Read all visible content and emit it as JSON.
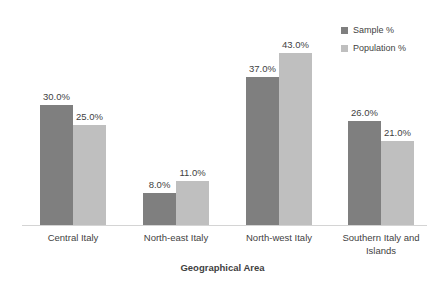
{
  "chart_data": {
    "type": "bar",
    "title": "",
    "subtitle": "",
    "xlabel": "Geographical Area",
    "ylabel": "",
    "categories": [
      "Central Italy",
      "North-east Italy",
      "North-west Italy",
      "Southern Italy and Islands"
    ],
    "series": [
      {
        "name": "Sample %",
        "color": "#7f7f7f",
        "values": [
          30.0,
          8.0,
          37.0,
          26.0
        ],
        "labels": [
          "30.0%",
          "8.0%",
          "37.0%",
          "26.0%"
        ]
      },
      {
        "name": "Population %",
        "color": "#bfbfbf",
        "values": [
          25.0,
          11.0,
          43.0,
          21.0
        ],
        "labels": [
          "25.0%",
          "11.0%",
          "43.0%",
          "21.0%"
        ]
      }
    ],
    "ylim": [
      0,
      47
    ],
    "grid": false,
    "y_axis_visible": false,
    "data_labels": true,
    "legend_position": "top-right"
  },
  "legend": {
    "entries": [
      {
        "label": "Sample %",
        "color": "#7f7f7f"
      },
      {
        "label": "Population %",
        "color": "#bfbfbf"
      }
    ]
  },
  "axis": {
    "x_title": "Geographical Area",
    "baseline_color": "#d4d4d4"
  }
}
